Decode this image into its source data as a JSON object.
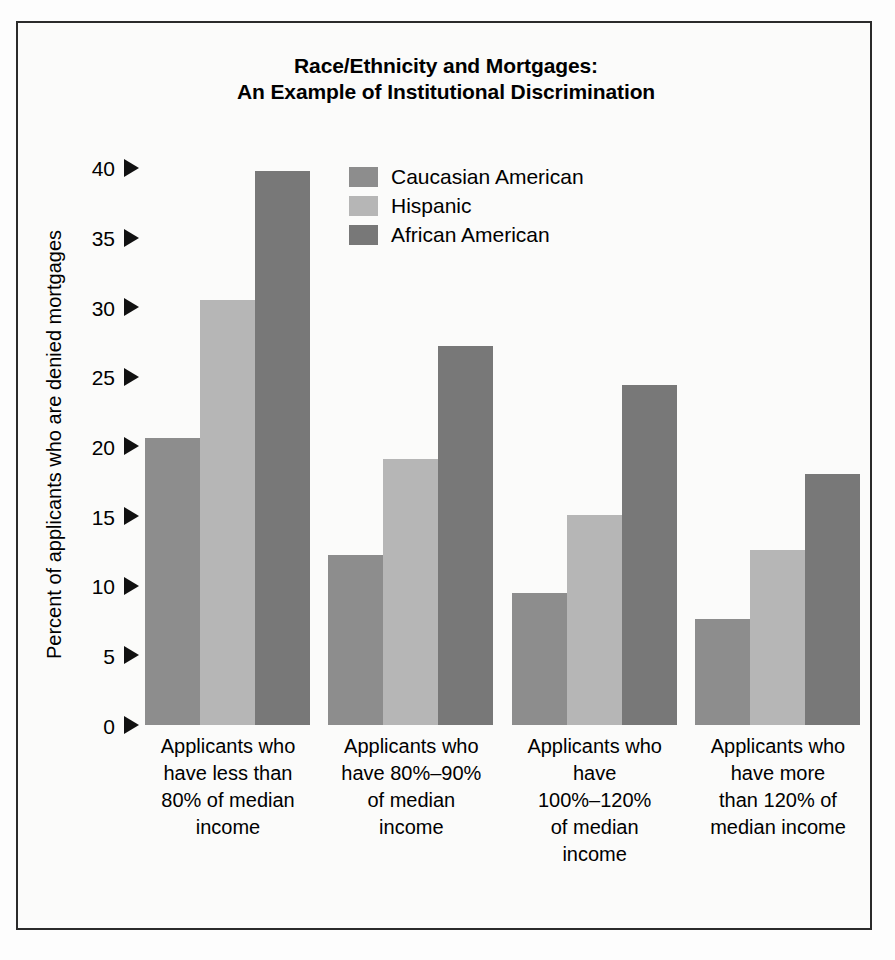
{
  "chart_data": {
    "type": "bar",
    "title": "Race/Ethnicity and Mortgages: An Example of Institutional Discrimination",
    "title_lines": [
      "Race/Ethnicity and Mortgages:",
      "An Example of Institutional Discrimination"
    ],
    "xlabel": "",
    "ylabel": "Percent of applicants who are denied mortgages",
    "ylim": [
      0,
      41.5
    ],
    "yticks": [
      0,
      5,
      10,
      15,
      20,
      25,
      30,
      35,
      40
    ],
    "ytick_labels": [
      "0",
      "5",
      "10",
      "15",
      "20",
      "25",
      "30",
      "35",
      "40"
    ],
    "grid": false,
    "legend_position": "upper-center",
    "categories": [
      "Applicants who have less than 80% of median income",
      "Applicants who have 80%-90% of median income",
      "Applicants who have 100%-120% of median income",
      "Applicants who have more than 120% of median income"
    ],
    "category_lines": [
      [
        "Applicants who",
        "have less than",
        "80% of median",
        "income"
      ],
      [
        "Applicants who",
        "have 80%–90%",
        "of median",
        "income"
      ],
      [
        "Applicants who",
        "have",
        "100%–120%",
        "of median",
        "income"
      ],
      [
        "Applicants who",
        "have more",
        "than 120% of",
        "median income"
      ]
    ],
    "series": [
      {
        "name": "Caucasian American",
        "color": "#8d8d8d",
        "values": [
          20.6,
          12.2,
          9.5,
          7.6
        ]
      },
      {
        "name": "Hispanic",
        "color": "#b6b6b6",
        "values": [
          30.5,
          19.1,
          15.1,
          12.6
        ]
      },
      {
        "name": "African American",
        "color": "#787878",
        "values": [
          39.8,
          27.2,
          24.4,
          18.0
        ]
      }
    ]
  },
  "legend": {
    "items": [
      {
        "label": "Caucasian American",
        "color": "#8d8d8d"
      },
      {
        "label": "Hispanic",
        "color": "#b6b6b6"
      },
      {
        "label": "African American",
        "color": "#787878"
      }
    ]
  },
  "colors": {
    "frame": "#2b2b2b",
    "background": "#fbfbfa",
    "text": "#000000",
    "caucasian_american": "#8d8d8d",
    "hispanic": "#b6b6b6",
    "african_american": "#787878"
  }
}
